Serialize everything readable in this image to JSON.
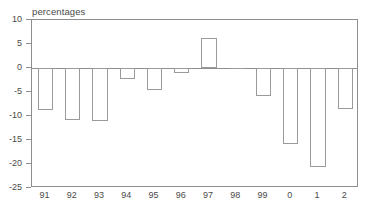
{
  "chart_data": {
    "type": "bar",
    "title": "percentages",
    "xlabel": "",
    "ylabel": "",
    "ylim": [
      -25,
      10
    ],
    "yticks": [
      10,
      5,
      0,
      -5,
      -10,
      -15,
      -20,
      -25
    ],
    "ytick_labels": [
      "10",
      "5",
      "0",
      "-5",
      "-10",
      "-15",
      "-20",
      "-25"
    ],
    "grid": false,
    "legend": "none",
    "categories": [
      "91",
      "92",
      "93",
      "94",
      "95",
      "96",
      "97",
      "98",
      "99",
      "0",
      "1",
      "2"
    ],
    "values": [
      -8.8,
      -10.8,
      -11.0,
      -2.3,
      -4.5,
      -1.0,
      6.2,
      0.0,
      -5.9,
      -15.8,
      -20.6,
      -8.6
    ],
    "series": [
      {
        "name": "percentages",
        "values": [
          -8.8,
          -10.8,
          -11.0,
          -2.3,
          -4.5,
          -1.0,
          6.2,
          0.0,
          -5.9,
          -15.8,
          -20.6,
          -8.6
        ]
      }
    ],
    "bar_edge_color": "#9a9a9a",
    "bar_fill_color": "#ffffff",
    "axis_color": "#8e8e8e"
  }
}
